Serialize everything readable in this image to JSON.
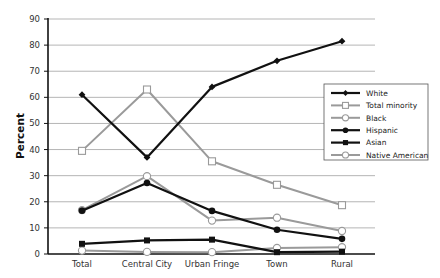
{
  "chart_data": {
    "type": "line",
    "title": "",
    "xlabel": "",
    "ylabel": "Percent",
    "ylim": [
      0,
      90
    ],
    "yticks": [
      0,
      10,
      20,
      30,
      40,
      50,
      60,
      70,
      80,
      90
    ],
    "grid": true,
    "legend_position": "right",
    "categories": [
      "Total",
      "Central City",
      "Urban Fringe",
      "Town",
      "Rural"
    ],
    "series": [
      {
        "name": "White",
        "values": [
          61,
          37,
          64,
          74,
          81.5
        ],
        "color": "#111111",
        "marker": "diamond",
        "width": 2.2
      },
      {
        "name": "Total minority",
        "values": [
          39.5,
          63,
          35.5,
          26.5,
          18.7
        ],
        "color": "#9a9a9a",
        "marker": "square-open",
        "width": 2
      },
      {
        "name": "Black",
        "values": [
          16.8,
          29.8,
          12.8,
          13.9,
          8.8
        ],
        "color": "#9a9a9a",
        "marker": "circle-open",
        "width": 2
      },
      {
        "name": "Hispanic",
        "values": [
          16.6,
          27.2,
          16.5,
          9.3,
          5.8
        ],
        "color": "#111111",
        "marker": "circle",
        "width": 2.2
      },
      {
        "name": "Asian",
        "values": [
          3.9,
          5.2,
          5.5,
          0.7,
          0.9
        ],
        "color": "#111111",
        "marker": "square",
        "width": 2.2
      },
      {
        "name": "Native American",
        "values": [
          1.3,
          0.8,
          0.7,
          2.3,
          2.6
        ],
        "color": "#9a9a9a",
        "marker": "circle-open",
        "width": 2
      }
    ]
  },
  "axis": {
    "y_title": "Percent"
  }
}
